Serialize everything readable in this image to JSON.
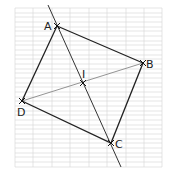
{
  "figure": {
    "type": "rhombus construction on grid paper",
    "points": [
      {
        "name": "A",
        "label": "A",
        "x": 57,
        "y": 26
      },
      {
        "name": "B",
        "label": "B",
        "x": 143,
        "y": 63
      },
      {
        "name": "C",
        "label": "C",
        "x": 111,
        "y": 143
      },
      {
        "name": "D",
        "label": "D",
        "x": 22,
        "y": 101
      },
      {
        "name": "I",
        "label": "I",
        "x": 83,
        "y": 83
      }
    ],
    "segments": [
      "AB",
      "BC",
      "CD",
      "DA",
      "DB"
    ],
    "lines": [
      "AC (extended)"
    ],
    "colors": {
      "grid": "#cfcfcf",
      "stroke": "#222222",
      "diagonal": "#888888"
    }
  }
}
